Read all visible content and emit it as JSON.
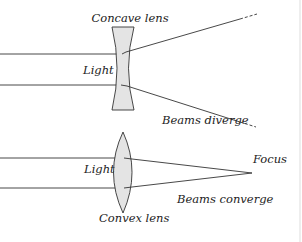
{
  "diagram": {
    "colors": {
      "line": "#333333",
      "lens_fill": "#e4e4e4",
      "lens_stroke": "#333333",
      "text": "#222222",
      "border": "#dddddd"
    },
    "concave": {
      "label": "Concave lens",
      "light_label": "Light",
      "beams_label": "Beams diverge"
    },
    "convex": {
      "label": "Convex lens",
      "light_label": "Light",
      "beams_label": "Beams converge",
      "focus_label": "Focus"
    }
  }
}
